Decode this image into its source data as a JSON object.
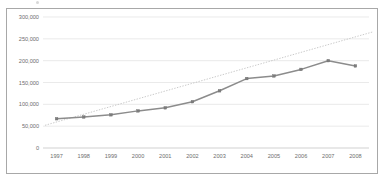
{
  "chart_data": {
    "type": "line",
    "title": "",
    "xlabel": "",
    "ylabel": "",
    "categories": [
      "1997",
      "1998",
      "1999",
      "2000",
      "2001",
      "2002",
      "2003",
      "2004",
      "2005",
      "2006",
      "2007",
      "2008"
    ],
    "values": [
      67000,
      71000,
      76000,
      85000,
      92000,
      106000,
      131000,
      159000,
      165000,
      180000,
      200000,
      188000
    ],
    "series": [
      {
        "name": "data",
        "values": [
          67000,
          71000,
          76000,
          85000,
          92000,
          106000,
          131000,
          159000,
          165000,
          180000,
          200000,
          188000
        ],
        "style": "solid-line-with-markers",
        "color": "#8c8c8c"
      },
      {
        "name": "trendline",
        "style": "dotted-linear-trendline",
        "color": "#bcbcbc",
        "start_value": 52000,
        "end_value": 266000
      }
    ],
    "ylim": [
      0,
      300000
    ],
    "yticks": [
      0,
      50000,
      100000,
      150000,
      200000,
      250000,
      300000
    ],
    "ytick_labels": [
      "0",
      "50,000",
      "100,000",
      "150,000",
      "200,000",
      "250,000",
      "300,000"
    ],
    "xtick_labels": [
      "1997",
      "1998",
      "1999",
      "2000",
      "2001",
      "2002",
      "2003",
      "2004",
      "2005",
      "2006",
      "2007",
      "2008"
    ],
    "grid": "horizontal-only",
    "legend": "none",
    "plot_background": "#ffffff",
    "border_color": "#a8a8a8"
  }
}
